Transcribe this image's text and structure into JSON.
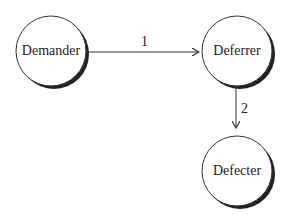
{
  "diagram": {
    "nodes": [
      {
        "id": "demander",
        "label": "Demander"
      },
      {
        "id": "deferrer",
        "label": "Deferrer"
      },
      {
        "id": "defecter",
        "label": "Defecter"
      }
    ],
    "edges": [
      {
        "from": "demander",
        "to": "deferrer",
        "label": "1"
      },
      {
        "from": "deferrer",
        "to": "defecter",
        "label": "2"
      }
    ]
  }
}
